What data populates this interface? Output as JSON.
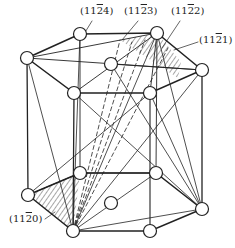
{
  "diagram": {
    "labels": [
      {
        "id": "plane-11-2-4",
        "text": "(11",
        "bar": "2",
        "tail": "4)",
        "x": 80,
        "y": 11
      },
      {
        "id": "plane-11-2-3",
        "text": "(11",
        "bar": "2",
        "tail": "3)",
        "x": 124,
        "y": 11
      },
      {
        "id": "plane-11-2-2",
        "text": "(11",
        "bar": "2",
        "tail": "2)",
        "x": 171,
        "y": 11
      },
      {
        "id": "plane-11-2-1",
        "text": "(11",
        "bar": "2",
        "tail": "1)",
        "x": 199,
        "y": 38
      },
      {
        "id": "plane-11-2-0",
        "text": "(11",
        "bar": "2",
        "tail": "0)",
        "x": 9,
        "y": 219
      }
    ],
    "colors": {
      "stroke": "#222222",
      "background": "#ffffff"
    }
  }
}
